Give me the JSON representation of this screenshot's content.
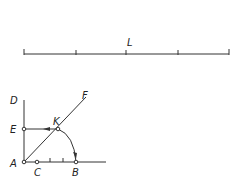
{
  "scale_bar": {
    "label": "L",
    "ticks": 5
  },
  "points": {
    "A": "A",
    "B": "B",
    "C": "C",
    "D": "D",
    "E": "E",
    "F": "F",
    "K": "K"
  },
  "colors": {
    "stroke": "#333333"
  }
}
